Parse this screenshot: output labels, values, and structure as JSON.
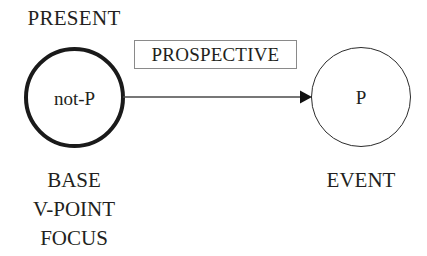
{
  "diagram": {
    "title_label": "PRESENT",
    "relation_box": {
      "label": "PROSPECTIVE",
      "border_color": "#8a8a8a"
    },
    "nodes": [
      {
        "id": "base",
        "text": "not-P",
        "emphasis": "thick",
        "border_color": "#1a1a1a",
        "captions": [
          "BASE",
          "V-POINT",
          "FOCUS"
        ]
      },
      {
        "id": "event",
        "text": "P",
        "emphasis": "thin",
        "border_color": "#2b2b2b",
        "captions": [
          "EVENT"
        ]
      }
    ],
    "arrow": {
      "direction": "left-to-right",
      "color": "#4a4a4a",
      "head": "solid-triangle"
    },
    "background_color": "#ffffff",
    "text_color": "#231f20"
  }
}
